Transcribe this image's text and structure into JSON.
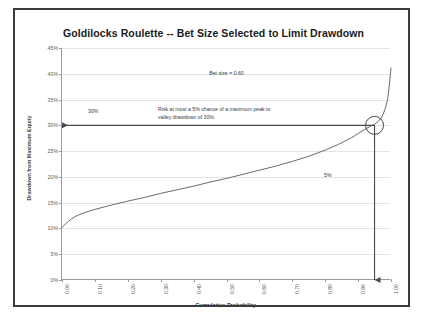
{
  "chart_data": {
    "type": "line",
    "title": "Goldilocks Roulette -- Bet Size Selected to Limit Drawdown",
    "xlabel": "Cumulative Probability",
    "ylabel": "Drawdown from Maximum Equity",
    "xlim": [
      0.0,
      1.0
    ],
    "ylim": [
      0.0,
      0.45
    ],
    "grid": true,
    "legend": "none",
    "xticklabels": [
      "0.00",
      "0.10",
      "0.20",
      "0.30",
      "0.40",
      "0.50",
      "0.60",
      "0.70",
      "0.80",
      "0.90",
      "1.00"
    ],
    "xtickvalues": [
      0.0,
      0.1,
      0.2,
      0.3,
      0.4,
      0.5,
      0.6,
      0.7,
      0.8,
      0.9,
      1.0
    ],
    "yticklabels": [
      "0%",
      "5%",
      "10%",
      "15%",
      "20%",
      "25%",
      "30%",
      "35%",
      "40%",
      "45%"
    ],
    "ytickvalues": [
      0,
      0.05,
      0.1,
      0.15,
      0.2,
      0.25,
      0.3,
      0.35,
      0.4,
      0.45
    ],
    "series": [
      {
        "name": "Drawdown quantile curve",
        "x": [
          0.0,
          0.01,
          0.02,
          0.03,
          0.04,
          0.05,
          0.07,
          0.1,
          0.13,
          0.16,
          0.2,
          0.25,
          0.3,
          0.35,
          0.4,
          0.45,
          0.5,
          0.55,
          0.6,
          0.65,
          0.7,
          0.75,
          0.8,
          0.84,
          0.88,
          0.9,
          0.92,
          0.94,
          0.95,
          0.96,
          0.97,
          0.975,
          0.98,
          0.985,
          0.99,
          0.995,
          1.0
        ],
        "y": [
          0.102,
          0.108,
          0.114,
          0.119,
          0.123,
          0.126,
          0.131,
          0.137,
          0.142,
          0.147,
          0.153,
          0.16,
          0.168,
          0.175,
          0.182,
          0.19,
          0.197,
          0.205,
          0.213,
          0.221,
          0.23,
          0.24,
          0.252,
          0.263,
          0.276,
          0.284,
          0.292,
          0.299,
          0.302,
          0.307,
          0.314,
          0.32,
          0.328,
          0.338,
          0.352,
          0.378,
          0.412
        ]
      }
    ],
    "annotations": {
      "bet_size": "Bet size = 0.60",
      "risk_note_line1": "Risk at most a 5% chance of a maximum peak to",
      "risk_note_line2": "valley drawdown of 30%.",
      "drawdown_label": "30%",
      "probability_label": "5%",
      "marker_point": {
        "x": 0.95,
        "y": 0.3,
        "shape": "circle"
      },
      "horizontal_arrow": {
        "from_x": 0.95,
        "to_x": 0.0,
        "y": 0.3
      },
      "vertical_arrow": {
        "x": 0.95,
        "from_y": 0.3,
        "to_y": 0.0
      }
    }
  },
  "frame": {
    "border_color": "#3a3a3a",
    "line_color": "#6b6b6b",
    "grid_color": "#e4e4e4",
    "axis_color": "#9a9a9a",
    "annotation_color": "#3a3a3a"
  }
}
